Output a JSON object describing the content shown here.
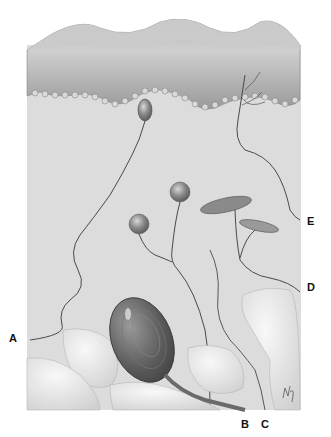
{
  "figure": {
    "colors": {
      "dermis": "#dcdcdc",
      "epidermis_top": "#c4c4c4",
      "epidermis_cells": "#a8a8a8",
      "basal_cells": "#8f8f8f",
      "nerve": "#4a4a4a",
      "receptor": "#6b6b6b",
      "fat_lobule": "#ececec"
    }
  },
  "labels": {
    "A": "A",
    "B": "B",
    "C": "C",
    "D": "D",
    "E": "E"
  }
}
